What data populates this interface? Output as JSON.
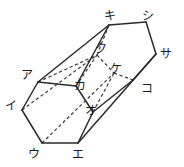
{
  "figure": {
    "name": "hexagonal-prism-diagram",
    "projection": "oblique",
    "background_color": "#ffffff",
    "line_color": "#2b2b2b",
    "hidden_line_color": "#3a3a3a",
    "labels": [
      {
        "id": "a",
        "text": "ア",
        "x": 21,
        "y": 69,
        "vertex_x": 38,
        "vertex_y": 82,
        "hidden": false
      },
      {
        "id": "i",
        "text": "イ",
        "x": 5,
        "y": 100,
        "vertex_x": 22,
        "vertex_y": 110,
        "hidden": false
      },
      {
        "id": "u",
        "text": "ウ",
        "x": 28,
        "y": 148,
        "vertex_x": 42,
        "vertex_y": 143,
        "hidden": false
      },
      {
        "id": "e",
        "text": "エ",
        "x": 72,
        "y": 149,
        "vertex_x": 78,
        "vertex_y": 143,
        "hidden": false
      },
      {
        "id": "o",
        "text": "オ",
        "x": 85,
        "y": 105,
        "vertex_x": 93,
        "vertex_y": 112,
        "hidden": false
      },
      {
        "id": "ka",
        "text": "カ",
        "x": 74,
        "y": 80,
        "vertex_x": 76,
        "vertex_y": 86,
        "hidden": false
      },
      {
        "id": "ki",
        "text": "キ",
        "x": 104,
        "y": 10,
        "vertex_x": 109,
        "vertex_y": 25,
        "hidden": false
      },
      {
        "id": "ku",
        "text": "ク",
        "x": 95,
        "y": 43,
        "vertex_x": 97,
        "vertex_y": 55,
        "hidden": true
      },
      {
        "id": "ke",
        "text": "ケ",
        "x": 110,
        "y": 63,
        "vertex_x": 114,
        "vertex_y": 73,
        "hidden": true
      },
      {
        "id": "ko",
        "text": "コ",
        "x": 141,
        "y": 83,
        "vertex_x": 133,
        "vertex_y": 80,
        "hidden": false
      },
      {
        "id": "sa",
        "text": "サ",
        "x": 160,
        "y": 48,
        "vertex_x": 156,
        "vertex_y": 54,
        "hidden": false
      },
      {
        "id": "shi",
        "text": "シ",
        "x": 142,
        "y": 10,
        "vertex_x": 146,
        "vertex_y": 22,
        "hidden": false
      }
    ],
    "edges_solid": [
      {
        "name": "edge-a-i",
        "from": "a",
        "to": "i"
      },
      {
        "name": "edge-i-u",
        "from": "i",
        "to": "u"
      },
      {
        "name": "edge-u-e",
        "from": "u",
        "to": "e"
      },
      {
        "name": "edge-e-o",
        "from": "e",
        "to": "o"
      },
      {
        "name": "edge-o-ka",
        "from": "o",
        "to": "ka"
      },
      {
        "name": "edge-ka-a",
        "from": "ka",
        "to": "a"
      },
      {
        "name": "edge-ki-shi",
        "from": "ki",
        "to": "shi"
      },
      {
        "name": "edge-shi-sa",
        "from": "shi",
        "to": "sa"
      },
      {
        "name": "edge-sa-ko",
        "from": "sa",
        "to": "ko"
      },
      {
        "name": "edge-ko-o",
        "from": "ko",
        "to": "o"
      },
      {
        "name": "edge-a-ki",
        "from": "a",
        "to": "ki"
      },
      {
        "name": "edge-ka-ki",
        "from": "ka",
        "to": "ki"
      },
      {
        "name": "edge-e-sa",
        "from": "e",
        "to": "sa"
      }
    ],
    "edges_hidden": [
      {
        "name": "hidden-edge-ki-ku",
        "from": "ki",
        "to": "ku"
      },
      {
        "name": "hidden-edge-ku-ke",
        "from": "ku",
        "to": "ke"
      },
      {
        "name": "hidden-edge-ke-ko",
        "from": "ke",
        "to": "ko"
      },
      {
        "name": "hidden-edge-a-ku",
        "from": "a",
        "to": "ku"
      },
      {
        "name": "hidden-edge-i-ku",
        "from": "i",
        "to": "ku"
      },
      {
        "name": "hidden-edge-u-ke",
        "from": "u",
        "to": "ke"
      },
      {
        "name": "hidden-edge-ka-ku",
        "from": "ka",
        "to": "ku"
      },
      {
        "name": "hidden-edge-o-ke",
        "from": "o",
        "to": "ke"
      }
    ]
  }
}
